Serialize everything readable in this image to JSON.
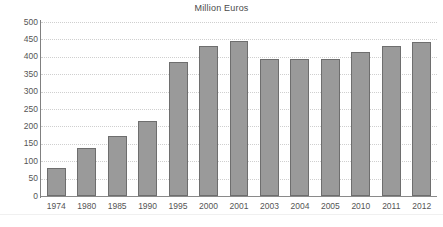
{
  "chart_data": {
    "type": "bar",
    "title": "Million Euros",
    "subtitle": "",
    "xlabel": "",
    "ylabel": "",
    "categories": [
      "1974",
      "1980",
      "1985",
      "1990",
      "1995",
      "2000",
      "2001",
      "2003",
      "2004",
      "2005",
      "2010",
      "2011",
      "2012"
    ],
    "values": [
      80,
      137,
      173,
      215,
      385,
      430,
      445,
      393,
      393,
      393,
      415,
      430,
      443
    ],
    "series": [
      {
        "name": "Million Euros",
        "values": [
          80,
          137,
          173,
          215,
          385,
          430,
          445,
          393,
          393,
          393,
          415,
          430,
          443
        ]
      }
    ],
    "ylim": [
      0,
      500
    ],
    "ytick_step": 50,
    "ytick_labels": [
      "500",
      "450",
      "400",
      "350",
      "300",
      "250",
      "200",
      "150",
      "100",
      "50",
      "0"
    ],
    "ytick_values": [
      500,
      450,
      400,
      350,
      300,
      250,
      200,
      150,
      100,
      50,
      0
    ],
    "grid": true,
    "grid_orientation": "horizontal",
    "grid_style": "dotted",
    "legend": false,
    "legend_position": "none",
    "annotations": [],
    "colors": {
      "bar_fill": "#9a9a9a",
      "bar_border": "#6e6e6e",
      "gridline": "#cfcfcf",
      "axis": "#808080",
      "text": "#555555",
      "title_text": "#4a4a4a",
      "background": "#ffffff"
    }
  }
}
